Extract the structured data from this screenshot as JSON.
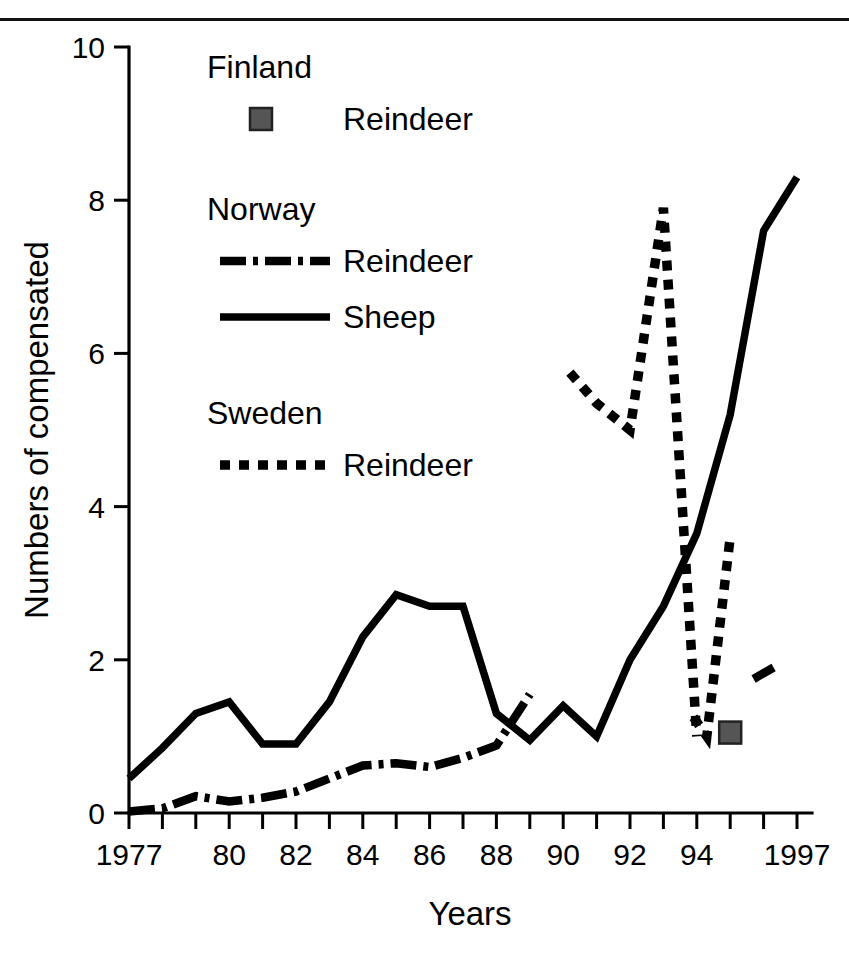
{
  "figure": {
    "background": "#ffffff",
    "ink_color": "#000000",
    "finland_marker_color": "#555555"
  },
  "axes": {
    "y_title": "Numbers of compensated",
    "x_title": "Years",
    "y_ticks": [
      "0",
      "2",
      "4",
      "6",
      "8",
      "10"
    ],
    "x_ticks": [
      "1977",
      "80",
      "82",
      "84",
      "86",
      "88",
      "90",
      "92",
      "94",
      "1997"
    ]
  },
  "legend": {
    "groups": [
      {
        "country": "Finland",
        "entries": [
          {
            "label": "Reindeer",
            "style": "filled-square-marker"
          }
        ]
      },
      {
        "country": "Norway",
        "entries": [
          {
            "label": "Reindeer",
            "style": "dash-dot-line"
          },
          {
            "label": "Sheep",
            "style": "solid-line"
          }
        ]
      },
      {
        "country": "Sweden",
        "entries": [
          {
            "label": "Reindeer",
            "style": "dotted-line"
          }
        ]
      }
    ]
  },
  "chart_data": {
    "type": "line",
    "title": "",
    "xlabel": "Years",
    "ylabel": "Numbers of compensated",
    "xlim": [
      1977,
      1997.5
    ],
    "ylim": [
      0,
      10
    ],
    "y_ticks": [
      0,
      2,
      4,
      6,
      8,
      10
    ],
    "x_tick_values": [
      1977,
      1980,
      1982,
      1984,
      1986,
      1988,
      1990,
      1992,
      1994,
      1997
    ],
    "x_tick_labels": [
      "1977",
      "80",
      "82",
      "84",
      "86",
      "88",
      "90",
      "92",
      "94",
      "1997"
    ],
    "x_minor_ticks_every": 1,
    "grid": false,
    "legend_position": "upper-left-inside",
    "series": [
      {
        "name": "Norway Sheep",
        "country": "Norway",
        "animal": "Sheep",
        "style": "solid",
        "x": [
          1977,
          1978,
          1979,
          1980,
          1981,
          1982,
          1983,
          1984,
          1985,
          1986,
          1987,
          1988,
          1989,
          1990,
          1991,
          1992,
          1993,
          1994,
          1995,
          1996,
          1997
        ],
        "y": [
          0.45,
          0.85,
          1.3,
          1.45,
          0.9,
          0.9,
          1.45,
          2.3,
          2.85,
          2.7,
          2.7,
          1.3,
          0.95,
          1.4,
          1.0,
          2.0,
          2.7,
          3.65,
          5.2,
          7.6,
          8.3
        ]
      },
      {
        "name": "Norway Reindeer",
        "country": "Norway",
        "animal": "Reindeer",
        "style": "dash-dot",
        "x": [
          1977,
          1978,
          1979,
          1980,
          1981,
          1982,
          1983,
          1984,
          1985,
          1986,
          1987,
          1988,
          1989
        ],
        "y": [
          0.02,
          0.06,
          0.22,
          0.15,
          0.2,
          0.28,
          0.45,
          0.62,
          0.65,
          0.6,
          0.72,
          0.88,
          1.55
        ]
      },
      {
        "name": "Norway Reindeer (late)",
        "country": "Norway",
        "animal": "Reindeer",
        "style": "dash-dot",
        "x": [
          1995.7,
          1996.3
        ],
        "y": [
          1.75,
          1.9
        ]
      },
      {
        "name": "Sweden Reindeer",
        "country": "Sweden",
        "animal": "Reindeer",
        "style": "dotted",
        "x": [
          1990.2,
          1991,
          1992,
          1993,
          1994
        ],
        "y": [
          5.75,
          5.35,
          5.0,
          7.9,
          1.0
        ]
      },
      {
        "name": "Sweden Reindeer (segment 2)",
        "country": "Sweden",
        "animal": "Reindeer",
        "style": "dotted",
        "x": [
          1993.9,
          1994.3,
          1995
        ],
        "y": [
          1.25,
          1.0,
          3.6
        ]
      },
      {
        "name": "Finland Reindeer",
        "country": "Finland",
        "animal": "Reindeer",
        "style": "marker",
        "x": [
          1995
        ],
        "y": [
          1.05
        ]
      }
    ]
  }
}
